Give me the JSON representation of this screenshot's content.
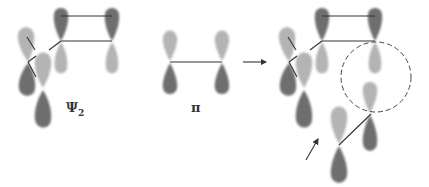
{
  "figure": {
    "colors": {
      "dark_lobe": "#6e6e6e",
      "light_lobe": "#b4b4b4",
      "bond_line": "#333333",
      "dashed_circle": "#444444"
    },
    "panels": [
      {
        "id": "psi2",
        "label_main": "Ψ",
        "label_sub": "2"
      },
      {
        "id": "pi",
        "label_main": "π"
      },
      {
        "id": "result",
        "label_main": ""
      }
    ],
    "arrow": {
      "direction": "right"
    }
  }
}
